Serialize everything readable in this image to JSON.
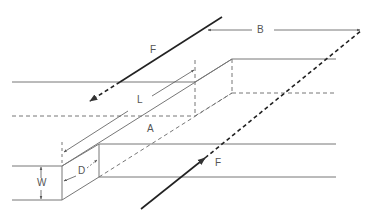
{
  "diagram": {
    "type": "geometric-schematic",
    "labels": {
      "F_top": "F",
      "B": "B",
      "L": "L",
      "A": "A",
      "W": "W",
      "D": "D",
      "F_bottom": "F"
    },
    "colors": {
      "line": "#777777",
      "force": "#222222",
      "text": "#555555"
    }
  }
}
